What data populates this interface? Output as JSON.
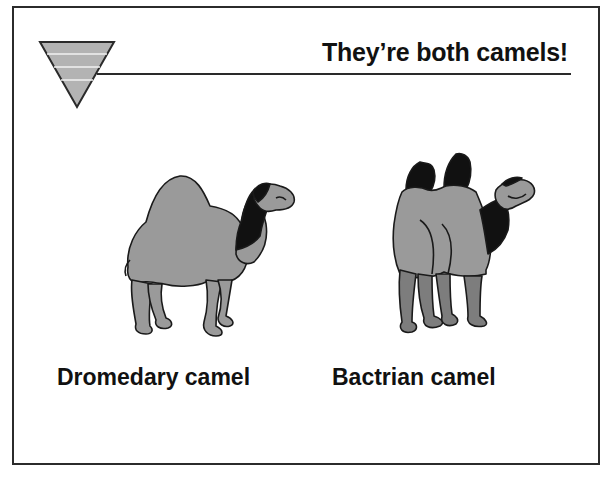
{
  "slide": {
    "title": "They’re both camels!",
    "logo_icon": "inverted-striped-triangle-icon",
    "colors": {
      "frame": "#2b2b2b",
      "camel_fill": "#9a9a9a",
      "camel_dark": "#111111",
      "camel_leg_shade": "#7d7d7d",
      "text": "#111111"
    },
    "figures": [
      {
        "id": "dromedary",
        "icon": "dromedary-camel-icon",
        "caption": "Dromedary camel"
      },
      {
        "id": "bactrian",
        "icon": "bactrian-camel-icon",
        "caption": "Bactrian camel"
      }
    ]
  }
}
